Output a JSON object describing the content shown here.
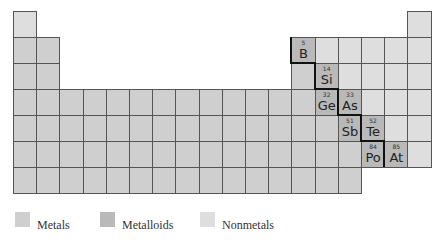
{
  "colors": {
    "metal": "#cfcfcf",
    "metalloid": "#b9b9b9",
    "nonmetal": "#dedede",
    "grid_line": "#555555",
    "boundary_line": "#111111"
  },
  "grid": {
    "left": 13,
    "top": 11,
    "cell_w": 23.2,
    "cell_h": 26,
    "columns": 18,
    "rows": 7
  },
  "rows": [
    {
      "period": 1,
      "cells": [
        {
          "col": 1,
          "type": "nonmetal"
        },
        {
          "col": 18,
          "type": "nonmetal"
        }
      ]
    },
    {
      "period": 2,
      "cells": [
        {
          "col": 1,
          "type": "metal"
        },
        {
          "col": 2,
          "type": "metal"
        },
        {
          "col": 13,
          "type": "metalloid",
          "number": "5",
          "symbol": "B"
        },
        {
          "col": 14,
          "type": "nonmetal"
        },
        {
          "col": 15,
          "type": "nonmetal"
        },
        {
          "col": 16,
          "type": "nonmetal"
        },
        {
          "col": 17,
          "type": "nonmetal"
        },
        {
          "col": 18,
          "type": "nonmetal"
        }
      ]
    },
    {
      "period": 3,
      "cells": [
        {
          "col": 1,
          "type": "metal"
        },
        {
          "col": 2,
          "type": "metal"
        },
        {
          "col": 13,
          "type": "metal"
        },
        {
          "col": 14,
          "type": "metalloid",
          "number": "14",
          "symbol": "Si"
        },
        {
          "col": 15,
          "type": "nonmetal"
        },
        {
          "col": 16,
          "type": "nonmetal"
        },
        {
          "col": 17,
          "type": "nonmetal"
        },
        {
          "col": 18,
          "type": "nonmetal"
        }
      ]
    },
    {
      "period": 4,
      "cells": [
        {
          "col": 1,
          "type": "metal"
        },
        {
          "col": 2,
          "type": "metal"
        },
        {
          "col": 3,
          "type": "metal"
        },
        {
          "col": 4,
          "type": "metal"
        },
        {
          "col": 5,
          "type": "metal"
        },
        {
          "col": 6,
          "type": "metal"
        },
        {
          "col": 7,
          "type": "metal"
        },
        {
          "col": 8,
          "type": "metal"
        },
        {
          "col": 9,
          "type": "metal"
        },
        {
          "col": 10,
          "type": "metal"
        },
        {
          "col": 11,
          "type": "metal"
        },
        {
          "col": 12,
          "type": "metal"
        },
        {
          "col": 13,
          "type": "metal"
        },
        {
          "col": 14,
          "type": "metalloid",
          "number": "32",
          "symbol": "Ge"
        },
        {
          "col": 15,
          "type": "metalloid",
          "number": "33",
          "symbol": "As"
        },
        {
          "col": 16,
          "type": "nonmetal"
        },
        {
          "col": 17,
          "type": "nonmetal"
        },
        {
          "col": 18,
          "type": "nonmetal"
        }
      ]
    },
    {
      "period": 5,
      "cells": [
        {
          "col": 1,
          "type": "metal"
        },
        {
          "col": 2,
          "type": "metal"
        },
        {
          "col": 3,
          "type": "metal"
        },
        {
          "col": 4,
          "type": "metal"
        },
        {
          "col": 5,
          "type": "metal"
        },
        {
          "col": 6,
          "type": "metal"
        },
        {
          "col": 7,
          "type": "metal"
        },
        {
          "col": 8,
          "type": "metal"
        },
        {
          "col": 9,
          "type": "metal"
        },
        {
          "col": 10,
          "type": "metal"
        },
        {
          "col": 11,
          "type": "metal"
        },
        {
          "col": 12,
          "type": "metal"
        },
        {
          "col": 13,
          "type": "metal"
        },
        {
          "col": 14,
          "type": "metal"
        },
        {
          "col": 15,
          "type": "metalloid",
          "number": "51",
          "symbol": "Sb"
        },
        {
          "col": 16,
          "type": "metalloid",
          "number": "52",
          "symbol": "Te"
        },
        {
          "col": 17,
          "type": "nonmetal"
        },
        {
          "col": 18,
          "type": "nonmetal"
        }
      ]
    },
    {
      "period": 6,
      "cells": [
        {
          "col": 1,
          "type": "metal"
        },
        {
          "col": 2,
          "type": "metal"
        },
        {
          "col": 3,
          "type": "metal"
        },
        {
          "col": 4,
          "type": "metal"
        },
        {
          "col": 5,
          "type": "metal"
        },
        {
          "col": 6,
          "type": "metal"
        },
        {
          "col": 7,
          "type": "metal"
        },
        {
          "col": 8,
          "type": "metal"
        },
        {
          "col": 9,
          "type": "metal"
        },
        {
          "col": 10,
          "type": "metal"
        },
        {
          "col": 11,
          "type": "metal"
        },
        {
          "col": 12,
          "type": "metal"
        },
        {
          "col": 13,
          "type": "metal"
        },
        {
          "col": 14,
          "type": "metal"
        },
        {
          "col": 15,
          "type": "metal"
        },
        {
          "col": 16,
          "type": "metalloid",
          "number": "84",
          "symbol": "Po"
        },
        {
          "col": 17,
          "type": "metalloid",
          "number": "85",
          "symbol": "At"
        },
        {
          "col": 18,
          "type": "nonmetal"
        }
      ]
    },
    {
      "period": 7,
      "cells": [
        {
          "col": 1,
          "type": "metal"
        },
        {
          "col": 2,
          "type": "metal"
        },
        {
          "col": 3,
          "type": "metal"
        },
        {
          "col": 4,
          "type": "metal"
        },
        {
          "col": 5,
          "type": "metal"
        },
        {
          "col": 6,
          "type": "metal"
        },
        {
          "col": 7,
          "type": "metal"
        },
        {
          "col": 8,
          "type": "metal"
        },
        {
          "col": 9,
          "type": "metal"
        },
        {
          "col": 10,
          "type": "metal"
        },
        {
          "col": 11,
          "type": "metal"
        },
        {
          "col": 12,
          "type": "metal"
        },
        {
          "col": 13,
          "type": "metal"
        },
        {
          "col": 14,
          "type": "metal"
        },
        {
          "col": 15,
          "type": "metal"
        }
      ]
    }
  ],
  "staircase": [
    [
      13,
      2
    ],
    [
      14,
      3
    ],
    [
      14,
      4
    ],
    [
      15,
      4
    ],
    [
      15,
      5
    ],
    [
      16,
      5
    ],
    [
      16,
      6
    ],
    [
      17,
      6
    ]
  ],
  "legend": [
    {
      "label": "Metals",
      "type": "metal",
      "x": 15
    },
    {
      "label": "Metalloids",
      "type": "metalloid",
      "x": 100
    },
    {
      "label": "Nonmetals",
      "type": "nonmetal",
      "x": 200
    }
  ]
}
